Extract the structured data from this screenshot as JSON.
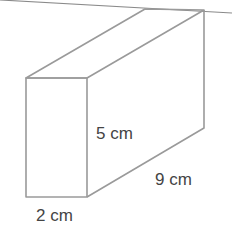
{
  "figure": {
    "shape": "rectangular prism",
    "colors": {
      "edge": "#9a9a9a",
      "text": "#444444",
      "background": "#ffffff"
    },
    "labels": {
      "height": "5 cm",
      "length": "9 cm",
      "width": "2 cm"
    }
  }
}
